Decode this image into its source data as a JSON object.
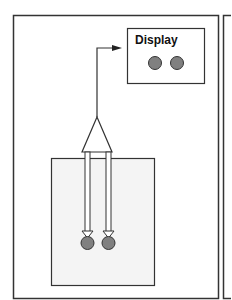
{
  "diagram": {
    "display_label": "Display",
    "colors": {
      "line": "#333333",
      "dot_fill": "#808080",
      "inner_box_fill": "#f4f4f4",
      "background": "#ffffff"
    },
    "display_dots": 2,
    "probe_dots": 2
  }
}
